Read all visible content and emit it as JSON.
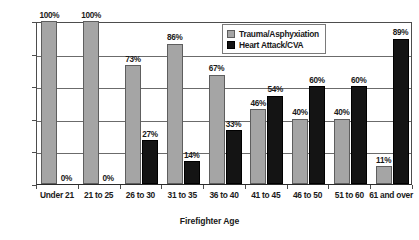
{
  "chart_data": {
    "type": "bar",
    "title": "",
    "xlabel": "Firefighter Age",
    "ylabel": "",
    "ylim": [
      0,
      100
    ],
    "grid": true,
    "legend_position": "top-right",
    "categories": [
      "Under 21",
      "21 to 25",
      "26 to 30",
      "31 to 35",
      "36 to 40",
      "41 to 45",
      "46 to 50",
      "51 to 60",
      "61 and over"
    ],
    "ytick_labels": [
      "0%",
      "20%",
      "40%",
      "60%",
      "80%",
      "100%"
    ],
    "ytick_values": [
      0,
      20,
      40,
      60,
      80,
      100
    ],
    "series": [
      {
        "name": "Trauma/Asphyxiation",
        "color": "#a5a5a5",
        "values": [
          100,
          100,
          73,
          86,
          67,
          46,
          40,
          40,
          11
        ],
        "labels": [
          "100%",
          "100%",
          "73%",
          "86%",
          "67%",
          "46%",
          "40%",
          "40%",
          "11%"
        ]
      },
      {
        "name": "Heart Attack/CVA",
        "color": "#141414",
        "values": [
          0,
          0,
          27,
          14,
          33,
          54,
          60,
          60,
          89
        ],
        "labels": [
          "0%",
          "0%",
          "27%",
          "14%",
          "33%",
          "54%",
          "60%",
          "60%",
          "89%"
        ]
      }
    ]
  }
}
